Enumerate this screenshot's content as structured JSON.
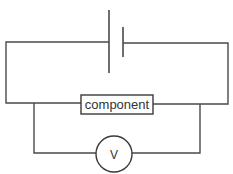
{
  "diagram": {
    "type": "circuit",
    "components": [
      {
        "id": "cell",
        "kind": "cell",
        "label": ""
      },
      {
        "id": "component",
        "kind": "resistor-box",
        "label": "component"
      },
      {
        "id": "voltmeter",
        "kind": "meter",
        "label": "V"
      }
    ],
    "connections": [
      {
        "from": "cell",
        "to": "component",
        "type": "series"
      },
      {
        "from": "voltmeter",
        "to": "component",
        "type": "parallel"
      }
    ],
    "colors": {
      "wire": "#4a4a4a",
      "background": "#ffffff",
      "text": "#333333"
    }
  }
}
